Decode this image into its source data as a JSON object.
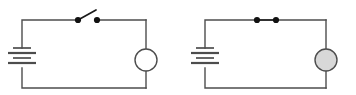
{
  "figure": {
    "background_color": "#ffffff",
    "wire_color": "#4d4d4d",
    "dot_color": "#111111",
    "lamp_lit_fill": "#d8d8d8",
    "lamp_unlit_fill": "#ffffff"
  },
  "circuits": [
    {
      "id": "left-circuit",
      "name": "open-circuit",
      "label": "",
      "switch": {
        "name": "switch-open",
        "state": "open",
        "state_label": "",
        "contact_left_x": 78,
        "contact_right_x": 97,
        "contact_y": 20,
        "lever_tip_x": 96,
        "lever_tip_y": 10
      },
      "lamp": {
        "name": "lamp-unlit",
        "state": "unlit",
        "state_label": "",
        "center_x": 146,
        "center_y": 60,
        "radius": 11,
        "fill": "#ffffff"
      },
      "battery": {
        "name": "battery",
        "label": "",
        "x": 22,
        "plates": [
          {
            "width": 18,
            "y": 48,
            "thick": false
          },
          {
            "width": 28,
            "y": 53,
            "thick": true
          },
          {
            "width": 18,
            "y": 58,
            "thick": false
          },
          {
            "width": 28,
            "y": 63,
            "thick": true
          }
        ]
      },
      "frame": {
        "left": 22,
        "right": 146,
        "top": 20,
        "bottom": 88
      }
    },
    {
      "id": "right-circuit",
      "name": "closed-circuit",
      "label": "",
      "switch": {
        "name": "switch-closed",
        "state": "closed",
        "state_label": "",
        "contact_left_x": 257,
        "contact_right_x": 276,
        "contact_y": 20,
        "lever_tip_x": 276,
        "lever_tip_y": 20
      },
      "lamp": {
        "name": "lamp-lit",
        "state": "lit",
        "state_label": "",
        "center_x": 326,
        "center_y": 60,
        "radius": 11,
        "fill": "#d8d8d8"
      },
      "battery": {
        "name": "battery",
        "label": "",
        "x": 205,
        "plates": [
          {
            "width": 18,
            "y": 48,
            "thick": false
          },
          {
            "width": 28,
            "y": 53,
            "thick": true
          },
          {
            "width": 18,
            "y": 58,
            "thick": false
          },
          {
            "width": 28,
            "y": 63,
            "thick": true
          }
        ]
      },
      "frame": {
        "left": 205,
        "right": 326,
        "top": 20,
        "bottom": 88
      }
    }
  ]
}
